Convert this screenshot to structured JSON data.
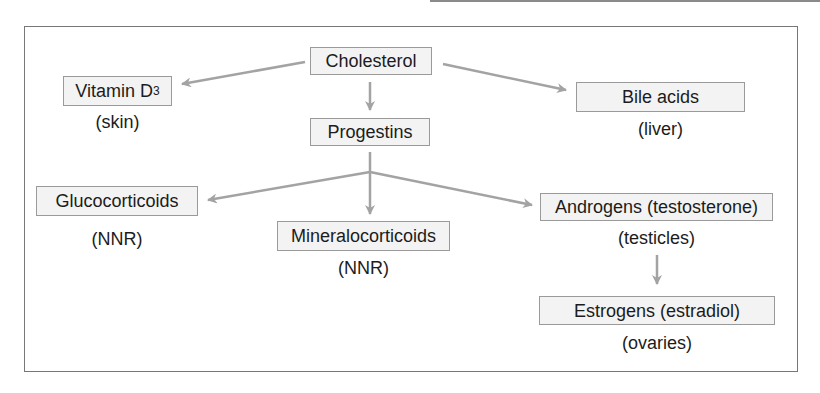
{
  "diagram": {
    "title": "",
    "nodes": [
      {
        "id": "cholesterol",
        "label": "Cholesterol",
        "location": ""
      },
      {
        "id": "vitamin_d3",
        "label": "Vitamin D",
        "subscript": "3",
        "location": "(skin)"
      },
      {
        "id": "bile_acids",
        "label": "Bile acids",
        "location": "(liver)"
      },
      {
        "id": "progestins",
        "label": "Progestins",
        "location": ""
      },
      {
        "id": "glucocorticoids",
        "label": "Glucocorticoids",
        "location": "(NNR)"
      },
      {
        "id": "mineralocorticoids",
        "label": "Mineralocorticoids",
        "location": "(NNR)"
      },
      {
        "id": "androgens",
        "label": "Androgens (testosterone)",
        "location": "(testicles)"
      },
      {
        "id": "estrogens",
        "label": "Estrogens (estradiol)",
        "location": "(ovaries)"
      }
    ],
    "edges": [
      {
        "from": "cholesterol",
        "to": "vitamin_d3"
      },
      {
        "from": "cholesterol",
        "to": "progestins"
      },
      {
        "from": "cholesterol",
        "to": "bile_acids"
      },
      {
        "from": "progestins",
        "to": "glucocorticoids"
      },
      {
        "from": "progestins",
        "to": "mineralocorticoids"
      },
      {
        "from": "progestins",
        "to": "androgens"
      },
      {
        "from": "androgens",
        "to": "estrogens"
      }
    ],
    "colors": {
      "arrow": "#a3a3a3",
      "box_border": "#9a9a9a",
      "box_fill": "#f3f3f3",
      "frame": "#777777"
    }
  }
}
